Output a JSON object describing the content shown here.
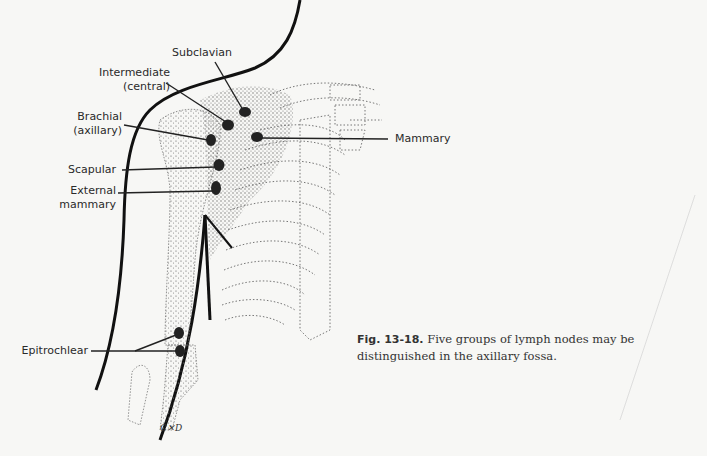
{
  "figure": {
    "labels": {
      "subclavian": "Subclavian",
      "intermediate_line1": "Intermediate",
      "intermediate_line2": "(central)",
      "brachial_line1": "Brachial",
      "brachial_line2": "(axillary)",
      "scapular": "Scapular",
      "external_line1": "External",
      "external_line2": "mammary",
      "mammary": "Mammary",
      "epitrochlear": "Epitrochlear"
    },
    "caption": {
      "number": "Fig. 13-18.",
      "text": " Five groups of lymph nodes may be distinguished in the axillary fossa."
    },
    "signature": "C✕D"
  }
}
